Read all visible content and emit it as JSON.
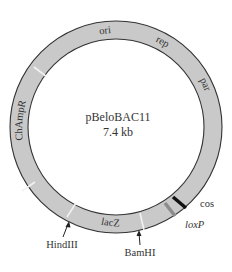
{
  "plasmid": {
    "name": "pBeloBAC11",
    "size": "7.4 kb"
  },
  "colors": {
    "ring_fill": "#c9c9c9",
    "ring_stroke": "#333333",
    "divider": "#f2f2f2",
    "cos_band": "#111111",
    "loxp_band": "#8c8c8c",
    "label": "#333333"
  },
  "segments": [
    {
      "label": "ori"
    },
    {
      "label": "rep"
    },
    {
      "label": "par"
    },
    {
      "label": "ChAmpR"
    },
    {
      "label": "lacZ"
    }
  ],
  "features": {
    "cos": "cos",
    "loxP": "loxP"
  },
  "restriction_sites": {
    "hindiii": "HindIII",
    "bamhi": "BamHI"
  }
}
